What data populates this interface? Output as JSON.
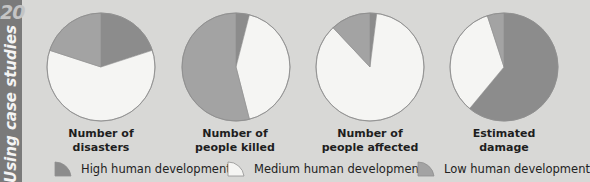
{
  "side": {
    "number": "20",
    "title": "Using case studies"
  },
  "colors": {
    "background": "#d8d8d6",
    "high": "#8c8c8c",
    "medium": "#f5f5f3",
    "low": "#a3a3a3",
    "outline": "#8f8f8f",
    "strip": "#7a7a7a"
  },
  "chart_data": {
    "type": "pie",
    "title": "",
    "legend_position": "bottom",
    "categories": [
      "High human development",
      "Medium human development",
      "Low human development"
    ],
    "series": [
      {
        "name": "Number of disasters",
        "values": [
          20,
          60,
          20
        ]
      },
      {
        "name": "Number of people killed",
        "values": [
          4,
          42,
          54
        ]
      },
      {
        "name": "Number of people affected",
        "values": [
          2,
          86,
          12
        ]
      },
      {
        "name": "Estimated damage",
        "values": [
          61,
          34,
          5
        ]
      }
    ]
  },
  "pies": [
    {
      "label_line1": "Number of",
      "label_line2": "disasters"
    },
    {
      "label_line1": "Number of",
      "label_line2": "people killed"
    },
    {
      "label_line1": "Number of",
      "label_line2": "people affected"
    },
    {
      "label_line1": "Estimated",
      "label_line2": "damage"
    }
  ],
  "legend": [
    {
      "label": "High human development",
      "swatch": "high"
    },
    {
      "label": "Medium human development",
      "swatch": "medium"
    },
    {
      "label": "Low human development",
      "swatch": "low"
    }
  ]
}
